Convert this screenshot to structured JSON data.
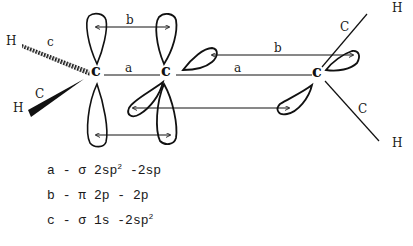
{
  "diagram": {
    "atoms": {
      "c_left": "c",
      "c_middle": "c",
      "c_right": "c",
      "h_top_left": "H",
      "h_bottom_left": "H",
      "h_top_right": "H",
      "h_bottom_right": "H"
    },
    "bond_labels": {
      "c_top_left": "c",
      "c_bottom_left": "C",
      "c_top_right": "C",
      "c_bottom_right": "C",
      "a_left": "a",
      "a_right": "a",
      "b_left": "b",
      "b_right": "b"
    }
  },
  "legend": [
    {
      "key": "a",
      "dash": "-",
      "symbol": "σ",
      "text_pre": "2sp",
      "sup": "2",
      "text_post": " -2sp"
    },
    {
      "key": "b",
      "dash": "-",
      "symbol": "π",
      "text_pre": "2p - 2p",
      "sup": "",
      "text_post": ""
    },
    {
      "key": "c",
      "dash": "-",
      "symbol": "σ",
      "text_pre": "1s -2sp",
      "sup": "2",
      "text_post": ""
    }
  ]
}
